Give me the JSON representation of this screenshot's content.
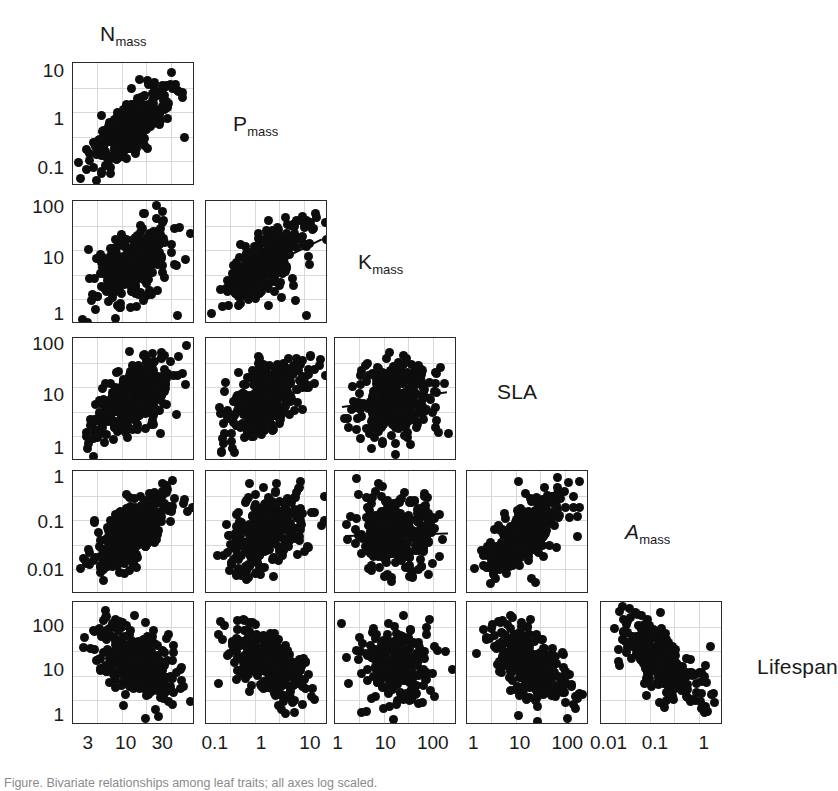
{
  "figure": {
    "kind": "scatterplot-matrix",
    "caption_fragment": "Figure. Bivariate relationships among leaf traits; all axes log scaled."
  },
  "variables": [
    {
      "key": "Nmass",
      "base": "N",
      "sub": "mass",
      "italic": false,
      "label_plain": "Nmass"
    },
    {
      "key": "Pmass",
      "base": "P",
      "sub": "mass",
      "italic": false,
      "label_plain": "Pmass"
    },
    {
      "key": "Kmass",
      "base": "K",
      "sub": "mass",
      "italic": false,
      "label_plain": "Kmass"
    },
    {
      "key": "SLA",
      "base": "SLA",
      "sub": "",
      "italic": false,
      "label_plain": "SLA"
    },
    {
      "key": "Amass",
      "base": "A",
      "sub": "mass",
      "italic": true,
      "label_plain": "Amass"
    },
    {
      "key": "Lifespan",
      "base": "Lifespan",
      "sub": "",
      "italic": false,
      "label_plain": "Lifespan"
    }
  ],
  "axes": {
    "row_ticks": [
      {
        "row": 0,
        "var": "Nmass",
        "labels": [
          "10",
          "1",
          "0.1"
        ],
        "positions": [
          0.07,
          0.46,
          0.86
        ]
      },
      {
        "row": 1,
        "var": "Pmass",
        "labels": [
          "100",
          "10",
          "1"
        ],
        "positions": [
          0.06,
          0.47,
          0.93
        ]
      },
      {
        "row": 2,
        "var": "Kmass",
        "labels": [
          "100",
          "10",
          "1"
        ],
        "positions": [
          0.06,
          0.47,
          0.9
        ]
      },
      {
        "row": 3,
        "var": "SLA",
        "labels": [
          "1",
          "0.1",
          "0.01"
        ],
        "positions": [
          0.06,
          0.42,
          0.81
        ]
      },
      {
        "row": 4,
        "var": "Amass",
        "labels": [
          "100",
          "10",
          "1"
        ],
        "positions": [
          0.2,
          0.56,
          0.93
        ]
      }
    ],
    "col_ticks": [
      {
        "col": 0,
        "var": "Nmass",
        "labels": [
          "3",
          "10",
          "30"
        ],
        "positions": [
          0.13,
          0.44,
          0.74
        ]
      },
      {
        "col": 1,
        "var": "Pmass",
        "labels": [
          "0.1",
          "1",
          "10"
        ],
        "positions": [
          0.08,
          0.46,
          0.86
        ]
      },
      {
        "col": 2,
        "var": "Kmass",
        "labels": [
          "1",
          "10",
          "100"
        ],
        "positions": [
          0.03,
          0.42,
          0.81
        ]
      },
      {
        "col": 3,
        "var": "SLA",
        "labels": [
          "1",
          "10",
          "100"
        ],
        "positions": [
          0.06,
          0.44,
          0.83
        ]
      },
      {
        "col": 4,
        "var": "Amass",
        "labels": [
          "0.01",
          "0.1",
          "1"
        ],
        "positions": [
          0.07,
          0.45,
          0.85
        ]
      }
    ]
  },
  "colors": {
    "point": "#0d0d0d",
    "frame": "#2b2b2b",
    "grid": "#d9d9d9",
    "background": "#ffffff",
    "text": "#1a1a1a"
  },
  "chart_data": {
    "type": "scatter",
    "title": "",
    "matrix": "lower-triangular 5x5 scatterplot matrix of 6 log-scaled leaf traits",
    "grid": true,
    "legend": "none",
    "axis_scale": "log10",
    "variables": [
      "Nmass",
      "Pmass",
      "Kmass",
      "SLA",
      "Amass",
      "Lifespan"
    ],
    "axis_ranges": {
      "Nmass": [
        2.0,
        45.0
      ],
      "Pmass": [
        0.05,
        20.0
      ],
      "Kmass": [
        0.7,
        200.0
      ],
      "SLA": [
        0.7,
        250.0
      ],
      "Amass": [
        0.004,
        2.0
      ],
      "Lifespan": [
        0.8,
        400.0
      ]
    },
    "panels": [
      {
        "row": 0,
        "col": 0,
        "x": "Nmass",
        "y": "Pmass",
        "trend": "positive",
        "fit": null,
        "n": 320,
        "corr": 0.74,
        "note": "dense positive cloud rising from lower-left to upper-right"
      },
      {
        "row": 1,
        "col": 0,
        "x": "Nmass",
        "y": "Kmass",
        "trend": "positive",
        "fit": null,
        "n": 300,
        "corr": 0.55
      },
      {
        "row": 1,
        "col": 1,
        "x": "Pmass",
        "y": "Kmass",
        "trend": "positive",
        "fit": {
          "x0": 0.1,
          "y0": 0.72,
          "x1": 0.95,
          "y1": 0.3
        },
        "n": 300,
        "corr": 0.7
      },
      {
        "row": 2,
        "col": 0,
        "x": "Nmass",
        "y": "SLA",
        "trend": "positive",
        "fit": null,
        "n": 330,
        "corr": 0.62
      },
      {
        "row": 2,
        "col": 1,
        "x": "Pmass",
        "y": "SLA",
        "trend": "positive",
        "fit": null,
        "n": 330,
        "corr": 0.52
      },
      {
        "row": 2,
        "col": 2,
        "x": "Kmass",
        "y": "SLA",
        "trend": "weak-positive",
        "fit": {
          "x0": 0.06,
          "y0": 0.55,
          "x1": 0.92,
          "y1": 0.43
        },
        "n": 300,
        "corr": 0.18
      },
      {
        "row": 3,
        "col": 0,
        "x": "Nmass",
        "y": "Amass",
        "trend": "positive",
        "fit": null,
        "n": 320,
        "corr": 0.66
      },
      {
        "row": 3,
        "col": 1,
        "x": "Pmass",
        "y": "Amass",
        "trend": "positive",
        "fit": null,
        "n": 320,
        "corr": 0.48
      },
      {
        "row": 3,
        "col": 2,
        "x": "Kmass",
        "y": "Amass",
        "trend": "flat",
        "fit": {
          "x0": 0.08,
          "y0": 0.52,
          "x1": 0.92,
          "y1": 0.5
        },
        "n": 290,
        "corr": 0.05
      },
      {
        "row": 3,
        "col": 3,
        "x": "SLA",
        "y": "Amass",
        "trend": "positive",
        "fit": null,
        "n": 320,
        "corr": 0.72
      },
      {
        "row": 4,
        "col": 0,
        "x": "Nmass",
        "y": "Lifespan",
        "trend": "negative",
        "fit": null,
        "n": 300,
        "corr": -0.55
      },
      {
        "row": 4,
        "col": 1,
        "x": "Pmass",
        "y": "Lifespan",
        "trend": "negative",
        "fit": null,
        "n": 290,
        "corr": -0.5
      },
      {
        "row": 4,
        "col": 2,
        "x": "Kmass",
        "y": "Lifespan",
        "trend": "weak-negative",
        "fit": null,
        "n": 200,
        "corr": -0.15
      },
      {
        "row": 4,
        "col": 3,
        "x": "SLA",
        "y": "Lifespan",
        "trend": "negative",
        "fit": null,
        "n": 310,
        "corr": -0.63
      },
      {
        "row": 4,
        "col": 4,
        "x": "Amass",
        "y": "Lifespan",
        "trend": "negative",
        "fit": null,
        "n": 300,
        "corr": -0.7
      }
    ]
  },
  "layout": {
    "cols_x": [
      72,
      205,
      334,
      466,
      600
    ],
    "rows_y": [
      62,
      200,
      337,
      470,
      601
    ],
    "panel_w": 122,
    "panel_h": 123,
    "diagonal_labels": [
      {
        "var": "Nmass",
        "x": 100,
        "y": 22
      },
      {
        "var": "Pmass",
        "x": 233,
        "y": 112
      },
      {
        "var": "Kmass",
        "x": 358,
        "y": 250
      },
      {
        "var": "SLA",
        "x": 497,
        "y": 380
      },
      {
        "var": "Amass",
        "x": 625,
        "y": 520
      },
      {
        "var": "Lifespan",
        "x": 757,
        "y": 655
      }
    ]
  }
}
